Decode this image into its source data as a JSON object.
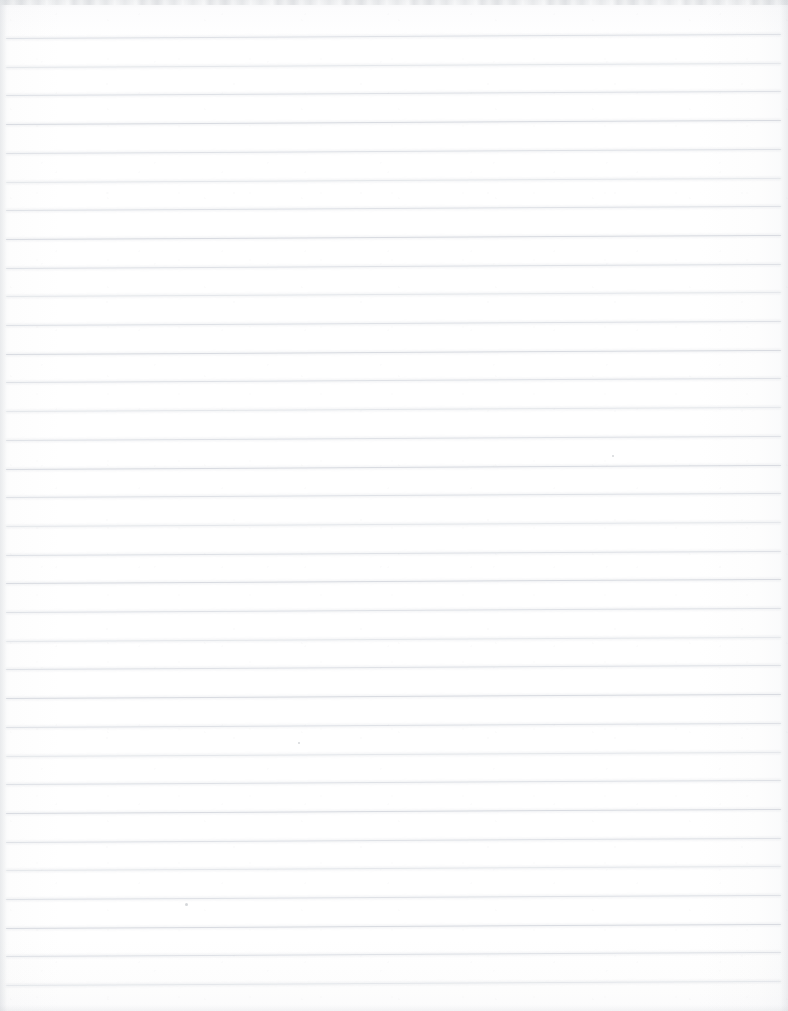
{
  "document": {
    "kind": "scanned-lined-paper",
    "title": "Blank lined notebook paper (scan)",
    "width": 788,
    "height": 1011,
    "text_content": "",
    "handwriting": "none",
    "printed_text": "none"
  },
  "paper": {
    "background_color": "#fefefe",
    "edge_shadow_color": "#b4b8be",
    "top_artifact_color": "#a8acb2",
    "grain_opacity": 0.35
  },
  "ruling": {
    "style": "college-ruled horizontal lines",
    "line_color": "#e1e3e7",
    "line_color_faint": "#eceef0",
    "line_color_strong": "#dcdee3",
    "line_thickness_px": 1,
    "line_count": 34,
    "first_line_y": 38,
    "spacing_px": 28.7,
    "left_inset_px": 6,
    "right_inset_px": 7,
    "skew_degrees": -0.3,
    "margin_rule": "none",
    "lines": [
      {
        "index": 1,
        "y": 38.0,
        "weight": "mid"
      },
      {
        "index": 2,
        "y": 66.7,
        "weight": "faint"
      },
      {
        "index": 3,
        "y": 95.4,
        "weight": "mid"
      },
      {
        "index": 4,
        "y": 124.1,
        "weight": "strong"
      },
      {
        "index": 5,
        "y": 152.8,
        "weight": "mid"
      },
      {
        "index": 6,
        "y": 181.5,
        "weight": "faint"
      },
      {
        "index": 7,
        "y": 210.2,
        "weight": "mid"
      },
      {
        "index": 8,
        "y": 238.9,
        "weight": "strong"
      },
      {
        "index": 9,
        "y": 267.6,
        "weight": "mid"
      },
      {
        "index": 10,
        "y": 296.3,
        "weight": "faint"
      },
      {
        "index": 11,
        "y": 325.0,
        "weight": "mid"
      },
      {
        "index": 12,
        "y": 353.7,
        "weight": "strong"
      },
      {
        "index": 13,
        "y": 382.4,
        "weight": "mid"
      },
      {
        "index": 14,
        "y": 411.1,
        "weight": "faint"
      },
      {
        "index": 15,
        "y": 439.8,
        "weight": "mid"
      },
      {
        "index": 16,
        "y": 468.5,
        "weight": "strong"
      },
      {
        "index": 17,
        "y": 497.2,
        "weight": "mid"
      },
      {
        "index": 18,
        "y": 525.9,
        "weight": "faint"
      },
      {
        "index": 19,
        "y": 554.6,
        "weight": "mid"
      },
      {
        "index": 20,
        "y": 583.3,
        "weight": "strong"
      },
      {
        "index": 21,
        "y": 612.0,
        "weight": "mid"
      },
      {
        "index": 22,
        "y": 640.7,
        "weight": "faint"
      },
      {
        "index": 23,
        "y": 669.4,
        "weight": "mid"
      },
      {
        "index": 24,
        "y": 698.1,
        "weight": "strong"
      },
      {
        "index": 25,
        "y": 726.8,
        "weight": "mid"
      },
      {
        "index": 26,
        "y": 755.5,
        "weight": "faint"
      },
      {
        "index": 27,
        "y": 784.2,
        "weight": "mid"
      },
      {
        "index": 28,
        "y": 812.9,
        "weight": "strong"
      },
      {
        "index": 29,
        "y": 841.6,
        "weight": "mid"
      },
      {
        "index": 30,
        "y": 870.3,
        "weight": "faint"
      },
      {
        "index": 31,
        "y": 899.0,
        "weight": "mid"
      },
      {
        "index": 32,
        "y": 927.7,
        "weight": "strong"
      },
      {
        "index": 33,
        "y": 956.4,
        "weight": "mid"
      },
      {
        "index": 34,
        "y": 985.1,
        "weight": "faint"
      }
    ]
  },
  "artifacts": {
    "stray_marks": [
      {
        "name": "pencil-dot",
        "x": 185,
        "y": 903,
        "size": 3
      },
      {
        "name": "speck",
        "x": 612,
        "y": 455,
        "size": 2
      },
      {
        "name": "speck",
        "x": 298,
        "y": 742,
        "size": 2
      }
    ]
  }
}
